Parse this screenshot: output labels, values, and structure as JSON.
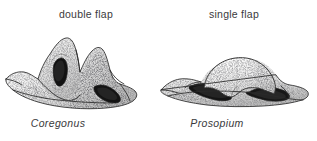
{
  "figure": {
    "type": "scientific-illustration",
    "background_color": "#ffffff",
    "ink_color": "#2b2b2b",
    "text_color": "#3a3a3c",
    "panels": [
      {
        "id": "left",
        "top_label": "double flap",
        "bottom_label": "Coregonus",
        "bottom_label_style": "italic",
        "specimen": {
          "description": "stippled bone with two tall pointed flaps and two dark openings",
          "flap_count": 2,
          "dark_openings": 2
        }
      },
      {
        "id": "right",
        "top_label": "single flap",
        "bottom_label": "Prosopium",
        "bottom_label_style": "italic",
        "specimen": {
          "description": "stippled bone with one broad rounded dome flap over a dark slit cavity",
          "flap_count": 1,
          "dark_openings": 1
        }
      }
    ]
  }
}
